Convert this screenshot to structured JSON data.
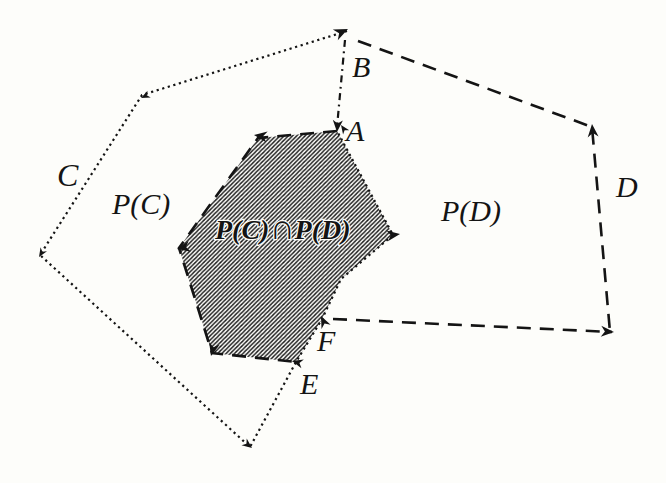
{
  "figure": {
    "width": 666,
    "height": 483,
    "background": "#fdfdfa",
    "ink": "#141414",
    "hatch": {
      "spacing": 4.2,
      "stroke_width": 1.35,
      "color": "#1a1a1a"
    },
    "line_styles": {
      "dotted": {
        "dasharray": "2.2 3.6",
        "width": 2.2
      },
      "dashed": {
        "dasharray": "14 9",
        "width": 2.6
      },
      "dashdot": {
        "dasharray": "7 4.5 1.8 4.5",
        "width": 2.2
      }
    },
    "region": {
      "name": "intersection-region",
      "points": [
        [
          337,
          131
        ],
        [
          258,
          138
        ],
        [
          179,
          248
        ],
        [
          212,
          353
        ],
        [
          296,
          362
        ],
        [
          322,
          319
        ],
        [
          341,
          279
        ],
        [
          393,
          235
        ]
      ]
    },
    "paths": [
      {
        "name": "polygon-C-outline",
        "style": "dotted",
        "points": [
          [
            347,
            31
          ],
          [
            142,
            95
          ],
          [
            40,
            255
          ],
          [
            250,
            447
          ],
          [
            296,
            362
          ],
          [
            322,
            319
          ],
          [
            341,
            279
          ],
          [
            393,
            235
          ],
          [
            337,
            131
          ]
        ]
      },
      {
        "name": "polygon-D-top-right-edges",
        "style": "dashed",
        "points": [
          [
            358,
            41
          ],
          [
            592,
            127
          ],
          [
            610,
            332
          ]
        ]
      },
      {
        "name": "polygon-D-bottom-edge",
        "style": "dashed",
        "points": [
          [
            333,
            319
          ],
          [
            612,
            332
          ]
        ]
      },
      {
        "name": "polygon-D-inner-boundary",
        "style": "dashed",
        "points": [
          [
            337,
            131
          ],
          [
            258,
            138
          ],
          [
            179,
            248
          ],
          [
            212,
            353
          ],
          [
            296,
            362
          ]
        ]
      },
      {
        "name": "segment-B-A",
        "style": "dashdot",
        "points": [
          [
            345,
            40
          ],
          [
            337,
            127
          ]
        ]
      }
    ],
    "arrows": [
      {
        "name": "arrow-vertex-B",
        "x": 348,
        "y": 29,
        "angle": -25,
        "size": 14
      },
      {
        "name": "arrow-A-down",
        "x": 337,
        "y": 132,
        "angle": 94,
        "size": 12
      },
      {
        "name": "arrow-A-upleft",
        "x": 341,
        "y": 125,
        "angle": -125,
        "size": 9
      },
      {
        "name": "arrow-region-topleft",
        "x": 254,
        "y": 135,
        "angle": -172,
        "size": 13
      },
      {
        "name": "arrow-region-left",
        "x": 177,
        "y": 249,
        "angle": 168,
        "size": 13
      },
      {
        "name": "arrow-region-botleft",
        "x": 211,
        "y": 356,
        "angle": 105,
        "size": 13
      },
      {
        "name": "arrow-vertex-E",
        "x": 292,
        "y": 361,
        "angle": -165,
        "size": 11
      },
      {
        "name": "arrow-vertex-F",
        "x": 321,
        "y": 316,
        "angle": -115,
        "size": 12
      },
      {
        "name": "arrow-region-right",
        "x": 400,
        "y": 234,
        "angle": -8,
        "size": 13
      },
      {
        "name": "arrow-D-top",
        "x": 592,
        "y": 124,
        "angle": -95,
        "size": 13
      },
      {
        "name": "arrow-D-bottomright",
        "x": 614,
        "y": 332,
        "angle": 3,
        "size": 13
      },
      {
        "name": "arrow-C-topleft",
        "x": 141,
        "y": 98,
        "angle": 155,
        "size": 9
      },
      {
        "name": "arrow-C-left",
        "x": 39,
        "y": 257,
        "angle": 122,
        "size": 9
      },
      {
        "name": "arrow-C-bottom",
        "x": 252,
        "y": 448,
        "angle": 38,
        "size": 10
      }
    ],
    "labels": [
      {
        "name": "label-C",
        "text": "C",
        "x": 57,
        "y": 186,
        "size": 32
      },
      {
        "name": "label-P-of-C",
        "text": "P(C)",
        "x": 112,
        "y": 214,
        "size": 30
      },
      {
        "name": "label-B",
        "text": "B",
        "x": 352,
        "y": 77,
        "size": 30
      },
      {
        "name": "label-A",
        "text": "A",
        "x": 346,
        "y": 141,
        "size": 30
      },
      {
        "name": "label-P-of-D",
        "text": "P(D)",
        "x": 441,
        "y": 221,
        "size": 30
      },
      {
        "name": "label-D",
        "text": "D",
        "x": 616,
        "y": 197,
        "size": 30
      },
      {
        "name": "label-F",
        "text": "F",
        "x": 317,
        "y": 351,
        "size": 30
      },
      {
        "name": "label-E",
        "text": "E",
        "x": 300,
        "y": 394,
        "size": 30
      }
    ],
    "intersection_label": {
      "name": "label-intersection",
      "x": 215,
      "y": 239,
      "halo": "#fdfdfa",
      "parts": [
        {
          "text": "P(C)",
          "size": 28
        },
        {
          "text": "∩",
          "size": 35
        },
        {
          "text": "P(D)",
          "size": 28
        }
      ]
    }
  }
}
